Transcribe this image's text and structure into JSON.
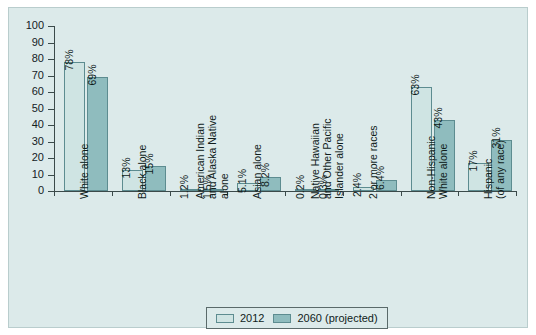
{
  "figure": {
    "background_color": "#dceaea",
    "panel_border_color": "#b9cdcd"
  },
  "legend": {
    "position": "bottom-center",
    "entries": [
      {
        "label": "2012",
        "color": "#cfe4e3"
      },
      {
        "label": "2060 (projected)",
        "color": "#8fbcbe"
      }
    ]
  },
  "chart_data": {
    "type": "bar",
    "title": "",
    "subtitle": "",
    "xlabel": "",
    "ylabel": "",
    "ylim": [
      0,
      100
    ],
    "yticks": [
      0,
      10,
      20,
      30,
      40,
      50,
      60,
      70,
      80,
      90,
      100
    ],
    "ytick_labels": [
      "0",
      "10",
      "20",
      "30",
      "40",
      "50",
      "60",
      "70",
      "80",
      "90",
      "100"
    ],
    "grid": false,
    "legend_position": "bottom",
    "categories": [
      "White alone",
      "Black alone",
      "American Indian and Alaska Native alone",
      "Asian alone",
      "Native Hawaiian and Other Pacific Islander alone",
      "2 or more races",
      "Non-Hispanic White alone",
      "Hispanic (of any race)"
    ],
    "category_label_lines": [
      [
        "White alone"
      ],
      [
        "Black alone"
      ],
      [
        "American Indian",
        "and Alaska Native",
        "alone"
      ],
      [
        "Asian alone"
      ],
      [
        "Native Hawaiian",
        "and Other Pacific",
        "Islander alone"
      ],
      [
        "2 or more races"
      ],
      [
        "Non-Hispanic",
        "White alone"
      ],
      [
        "Hispanic",
        "(of any race)"
      ]
    ],
    "series": [
      {
        "name": "2012",
        "color": "#cfe4e3",
        "values": [
          78,
          13,
          1.2,
          5.1,
          0.2,
          2.4,
          63,
          17
        ],
        "data_labels": [
          "78%",
          "13%",
          "1.2%",
          "5.1%",
          "0.2%",
          "2.4%",
          "63%",
          "17%"
        ]
      },
      {
        "name": "2060 (projected)",
        "color": "#8fbcbe",
        "values": [
          69,
          15,
          1.5,
          8.2,
          0.3,
          6.4,
          43,
          31
        ],
        "data_labels": [
          "69%",
          "15%",
          "1.5%",
          "8.2%",
          "0.3%",
          "6.4%",
          "43%",
          "31%"
        ]
      }
    ]
  }
}
